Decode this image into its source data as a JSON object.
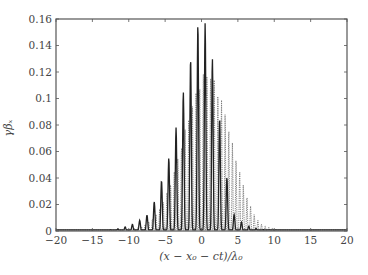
{
  "chart_data": {
    "type": "line",
    "title": "",
    "xlabel": "(x − x₀ − ct)/λ₀",
    "ylabel": "γβₓ",
    "xlim": [
      -20,
      20
    ],
    "ylim": [
      0,
      0.16
    ],
    "grid": false,
    "legend": null,
    "x_ticks": [
      -20,
      -15,
      -10,
      -5,
      0,
      5,
      10,
      15,
      20
    ],
    "x_tick_labels": [
      "−20",
      "−15",
      "−10",
      "−5",
      "0",
      "5",
      "10",
      "15",
      "20"
    ],
    "y_ticks": [
      0,
      0.02,
      0.04,
      0.06,
      0.08,
      0.1,
      0.12,
      0.14,
      0.16
    ],
    "y_tick_labels": [
      "0",
      "0.02",
      "0.04",
      "0.06",
      "0.08",
      "0.1",
      "0.12",
      "0.14",
      "0.16"
    ],
    "series": [
      {
        "name": "solid",
        "style": "solid",
        "color": "#222222",
        "peaks_x": [
          -10.5,
          -9.5,
          -8.5,
          -7.5,
          -6.5,
          -5.5,
          -4.5,
          -3.5,
          -2.5,
          -1.5,
          -0.5,
          0.5,
          1.5,
          2.5,
          3.5,
          4.5
        ],
        "peaks_y": [
          0.003,
          0.005,
          0.008,
          0.012,
          0.022,
          0.038,
          0.055,
          0.078,
          0.105,
          0.13,
          0.156,
          0.157,
          0.13,
          0.085,
          0.04,
          0.012
        ]
      },
      {
        "name": "dotted",
        "style": "dotted",
        "color": "#777777",
        "peaks_x": [
          -8,
          -7,
          -6,
          -5,
          -4,
          -3,
          -2,
          -1,
          0,
          1,
          2,
          3,
          4,
          5,
          6,
          7,
          8
        ],
        "peaks_y": [
          0.004,
          0.008,
          0.014,
          0.025,
          0.04,
          0.06,
          0.082,
          0.1,
          0.118,
          0.12,
          0.112,
          0.095,
          0.072,
          0.05,
          0.03,
          0.015,
          0.006
        ]
      }
    ]
  }
}
